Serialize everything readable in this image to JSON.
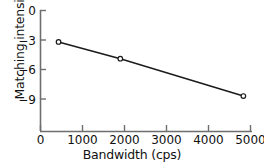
{
  "chart_data": {
    "type": "line",
    "title": "",
    "xlabel": "Bandwidth (cps)",
    "ylabel": "Matching intensity (db)",
    "xlim": [
      0,
      5000
    ],
    "ylim": [
      -10.6,
      0
    ],
    "grid": false,
    "legend": null,
    "xticks": [
      0,
      1000,
      2000,
      3000,
      4000,
      5000
    ],
    "xtick_labels": [
      "0",
      "1000",
      "2000",
      "3000",
      "4000",
      "5000"
    ],
    "yticks": [
      0,
      -3,
      -6,
      -9
    ],
    "ytick_labels": [
      "0",
      "−3",
      "−6",
      "−9"
    ],
    "marker": "open-circle",
    "line_color": "#1a1a1a",
    "series": [
      {
        "name": "matching intensity",
        "x": [
          430,
          1900,
          4830
        ],
        "y": [
          -3.2,
          -4.9,
          -8.7
        ]
      }
    ]
  },
  "axis": {
    "color": "#6e6e6e",
    "x_label": "Bandwidth (cps)",
    "y_label": "Matching intensity (db)"
  }
}
